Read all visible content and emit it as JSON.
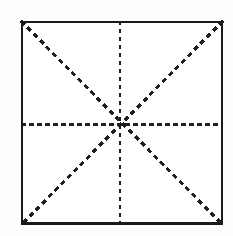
{
  "figure": {
    "name": "mi-zi-ge-calligraphy-grid",
    "canvas": {
      "width": 233,
      "height": 236,
      "background": "#fdfdfd"
    },
    "square": {
      "left": 21,
      "top": 21,
      "right": 223,
      "bottom": 225,
      "width": 202,
      "height": 204,
      "stroke_color": "#1a1a1a",
      "stroke_width": 2,
      "bottom_stroke_width": 3,
      "fill": "#ffffff"
    },
    "center_point": {
      "x": 120,
      "y": 124
    },
    "guides": [
      {
        "id": "horizontal-midline",
        "label": "Horizontal center guide",
        "orientation": "horizontal",
        "x1": 21,
        "y1": 124,
        "x2": 223,
        "y2": 124,
        "stroke_color": "#1f1f1f",
        "stroke_width": 3,
        "dash": 5,
        "gap": 3
      },
      {
        "id": "vertical-midline",
        "label": "Vertical center guide",
        "orientation": "vertical",
        "x1": 120,
        "y1": 21,
        "x2": 120,
        "y2": 225,
        "stroke_color": "#1f1f1f",
        "stroke_width": 2.4,
        "dash": 4,
        "gap": 4
      },
      {
        "id": "diagonal-tl-br",
        "label": "Diagonal guide top-left to bottom-right",
        "orientation": "diagonal",
        "x1": 21,
        "y1": 21,
        "x2": 223,
        "y2": 225,
        "stroke_color": "#1f1f1f",
        "stroke_width": 3.2,
        "dash": 5,
        "gap": 4
      },
      {
        "id": "diagonal-tr-bl",
        "label": "Diagonal guide top-right to bottom-left",
        "orientation": "diagonal",
        "x1": 223,
        "y1": 21,
        "x2": 21,
        "y2": 225,
        "stroke_color": "#1f1f1f",
        "stroke_width": 3.2,
        "dash": 5,
        "gap": 4
      }
    ]
  },
  "chart_data": {
    "type": "diagram",
    "title": "",
    "subtitle": "",
    "xlabel": "",
    "ylabel": "",
    "grid": true,
    "legend": null,
    "annotations": [],
    "shapes": [
      {
        "kind": "rectangle",
        "name": "outer-square",
        "x": 21,
        "y": 21,
        "width": 202,
        "height": 204,
        "stroke": "#1a1a1a",
        "stroke_width": 2,
        "style": "solid",
        "fill": "#ffffff"
      },
      {
        "kind": "line",
        "name": "horizontal-midline",
        "x1": 21,
        "y1": 124,
        "x2": 223,
        "y2": 124,
        "stroke": "#1f1f1f",
        "stroke_width": 3,
        "style": "dashed"
      },
      {
        "kind": "line",
        "name": "vertical-midline",
        "x1": 120,
        "y1": 21,
        "x2": 120,
        "y2": 225,
        "stroke": "#1f1f1f",
        "stroke_width": 2.4,
        "style": "dashed"
      },
      {
        "kind": "line",
        "name": "diagonal-tl-br",
        "x1": 21,
        "y1": 21,
        "x2": 223,
        "y2": 225,
        "stroke": "#1f1f1f",
        "stroke_width": 3.2,
        "style": "dashed"
      },
      {
        "kind": "line",
        "name": "diagonal-tr-bl",
        "x1": 223,
        "y1": 21,
        "x2": 21,
        "y2": 225,
        "stroke": "#1f1f1f",
        "stroke_width": 3.2,
        "style": "dashed"
      }
    ],
    "points": [
      {
        "name": "center",
        "x": 120,
        "y": 124
      },
      {
        "name": "corner-top-left",
        "x": 21,
        "y": 21
      },
      {
        "name": "corner-top-right",
        "x": 223,
        "y": 21
      },
      {
        "name": "corner-bottom-left",
        "x": 21,
        "y": 225
      },
      {
        "name": "corner-bottom-right",
        "x": 223,
        "y": 225
      }
    ]
  }
}
